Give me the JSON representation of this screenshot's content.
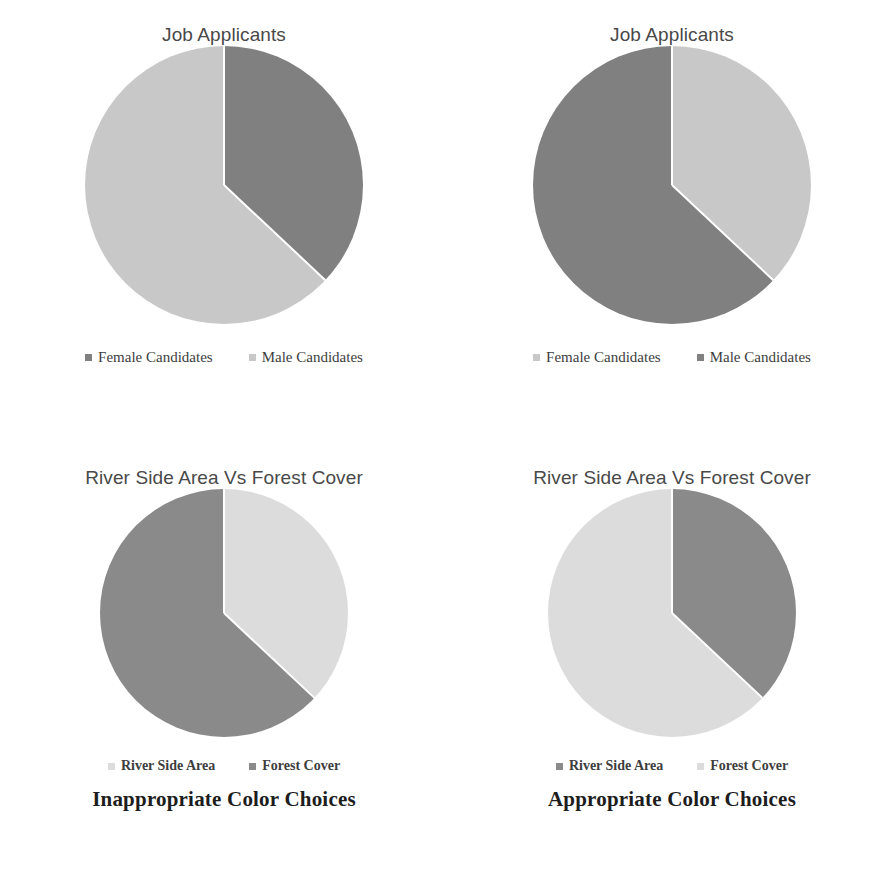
{
  "chart_data": [
    {
      "id": "top-left",
      "type": "pie",
      "title": "Job Applicants",
      "categories": [
        "Female Candidates",
        "Male Candidates"
      ],
      "values": [
        37,
        63
      ],
      "colors": [
        "#808080",
        "#c8c8c8"
      ],
      "legend_position": "bottom",
      "start_angle": 0,
      "quality": "inappropriate"
    },
    {
      "id": "top-right",
      "type": "pie",
      "title": "Job Applicants",
      "categories": [
        "Female Candidates",
        "Male Candidates"
      ],
      "values": [
        37,
        63
      ],
      "colors": [
        "#c8c8c8",
        "#808080"
      ],
      "legend_position": "bottom",
      "start_angle": 0,
      "quality": "appropriate"
    },
    {
      "id": "bottom-left",
      "type": "pie",
      "title": "River Side Area Vs Forest Cover",
      "categories": [
        "River Side Area",
        "Forest Cover"
      ],
      "values": [
        37,
        63
      ],
      "colors": [
        "#dcdcdc",
        "#8a8a8a"
      ],
      "legend_position": "bottom",
      "start_angle": 0,
      "quality": "inappropriate"
    },
    {
      "id": "bottom-right",
      "type": "pie",
      "title": "River Side Area Vs Forest Cover",
      "categories": [
        "River Side Area",
        "Forest Cover"
      ],
      "values": [
        37,
        63
      ],
      "colors": [
        "#8a8a8a",
        "#dcdcdc"
      ],
      "legend_position": "bottom",
      "start_angle": 0,
      "quality": "appropriate"
    }
  ],
  "panels": {
    "top_left": {
      "title": "Job Applicants",
      "legend": [
        {
          "label": "Female Candidates",
          "color": "#808080"
        },
        {
          "label": "Male Candidates",
          "color": "#c8c8c8"
        }
      ]
    },
    "top_right": {
      "title": "Job Applicants",
      "legend": [
        {
          "label": "Female Candidates",
          "color": "#c8c8c8"
        },
        {
          "label": "Male Candidates",
          "color": "#808080"
        }
      ]
    },
    "bottom_left": {
      "title": "River Side Area Vs Forest Cover",
      "legend": [
        {
          "label": "River Side Area",
          "color": "#dcdcdc"
        },
        {
          "label": "Forest Cover",
          "color": "#8a8a8a"
        }
      ],
      "caption": "Inappropriate Color Choices"
    },
    "bottom_right": {
      "title": "River Side Area Vs Forest Cover",
      "legend": [
        {
          "label": "River Side Area",
          "color": "#8a8a8a"
        },
        {
          "label": "Forest Cover",
          "color": "#dcdcdc"
        }
      ],
      "caption": "Appropriate Color Choices"
    }
  }
}
